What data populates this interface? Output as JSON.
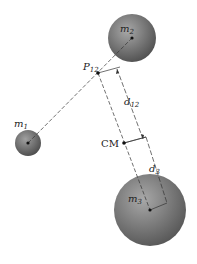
{
  "diagram": {
    "type": "center-of-mass construction",
    "masses": [
      {
        "id": "m1",
        "label": "m",
        "subscript": "1",
        "cx": 28,
        "cy": 143,
        "r": 13
      },
      {
        "id": "m2",
        "label": "m",
        "subscript": "2",
        "cx": 132,
        "cy": 38,
        "r": 24
      },
      {
        "id": "m3",
        "label": "m",
        "subscript": "3",
        "cx": 150,
        "cy": 210,
        "r": 36
      }
    ],
    "points": {
      "p12": {
        "label": "P",
        "subscript": "12",
        "x": 98,
        "y": 73
      },
      "cm": {
        "label": "CM",
        "x": 124,
        "y": 143
      }
    },
    "dimensions": {
      "d12": {
        "label": "d",
        "subscript": "12"
      },
      "d3": {
        "label": "d",
        "subscript": "3"
      }
    },
    "colors": {
      "sphere_dark": "#4a4a4a",
      "sphere_light": "#9a9a9a",
      "line": "#333333",
      "background": "#ffffff"
    }
  }
}
